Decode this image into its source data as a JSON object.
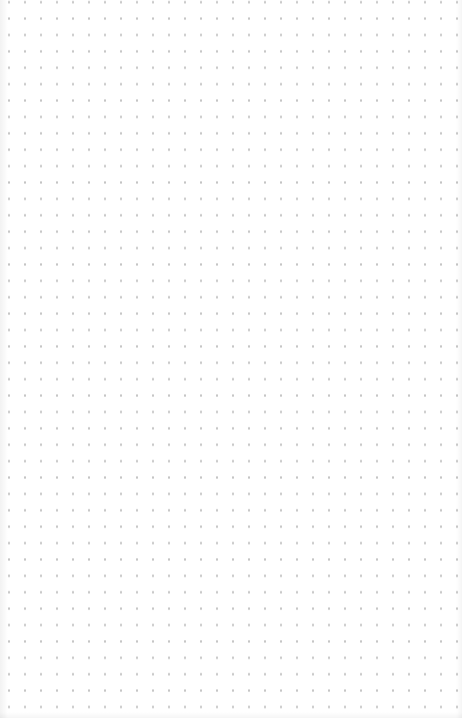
{
  "canvas": {
    "type": "dot-grid",
    "background_color": "#ffffff",
    "dot_color": "#c4c4c4",
    "grid_spacing_px": 16
  }
}
